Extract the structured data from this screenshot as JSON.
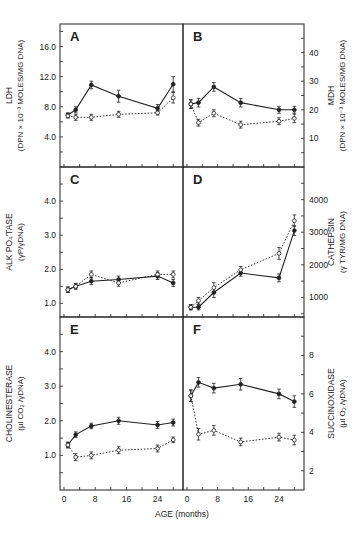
{
  "figure": {
    "xlabel": "AGE (months)",
    "x_ticks_left": [
      "0",
      "8",
      "16",
      "24"
    ],
    "x_ticks_right": [
      "0",
      "8",
      "16",
      "24"
    ]
  },
  "chart_data": [
    {
      "panel": "A",
      "type": "line",
      "ylabel": "LDH",
      "ylabel2": "(DPN × 10⁻³ MOLES/MG DNA)",
      "axis_side": "left",
      "ylim": [
        0,
        19
      ],
      "yticks": [
        4.0,
        8.0,
        12.0,
        16.0
      ],
      "ytick_labels": [
        "4.0",
        "8.0",
        "12.0",
        "16.0"
      ],
      "x": [
        1,
        3,
        7,
        14,
        24,
        28
      ],
      "series": [
        {
          "name": "solid (filled circles)",
          "style": "solid",
          "values": [
            6.9,
            7.6,
            10.9,
            9.4,
            7.8,
            11.0
          ],
          "err": [
            0.3,
            0.4,
            0.5,
            0.8,
            0.5,
            1.0
          ]
        },
        {
          "name": "dotted (open circles)",
          "style": "dotted",
          "values": [
            6.8,
            6.6,
            6.6,
            7.0,
            7.2,
            9.2
          ],
          "err": [
            0.3,
            0.4,
            0.4,
            0.4,
            0.3,
            0.7
          ]
        }
      ]
    },
    {
      "panel": "B",
      "type": "line",
      "ylabel": "MDH",
      "ylabel2": "(DPN × 10⁻³ MOLES/MG DNA)",
      "axis_side": "right",
      "ylim": [
        0,
        50
      ],
      "yticks": [
        10,
        20,
        30,
        40
      ],
      "ytick_labels": [
        "10",
        "20",
        "30",
        "40"
      ],
      "x": [
        1,
        3,
        7,
        14,
        24,
        28
      ],
      "series": [
        {
          "name": "solid (filled circles)",
          "style": "solid",
          "values": [
            22,
            22.5,
            28,
            22.5,
            20,
            20
          ],
          "err": [
            1.5,
            1.5,
            1.5,
            1.5,
            1.2,
            1.2
          ]
        },
        {
          "name": "dotted (open circles)",
          "style": "dotted",
          "values": [
            22,
            15.5,
            18.8,
            14.8,
            16,
            17
          ],
          "err": [
            1.5,
            1.2,
            1.2,
            1.2,
            1.2,
            1.5
          ]
        }
      ]
    },
    {
      "panel": "C",
      "type": "line",
      "ylabel": "ALK PO₄'TASE",
      "ylabel2": "(γP/γDNA)",
      "axis_side": "left",
      "ylim": [
        0.6,
        5.0
      ],
      "yticks": [
        1.0,
        2.0,
        3.0,
        4.0
      ],
      "ytick_labels": [
        "1.0",
        "2.0",
        "3.0",
        "4.0"
      ],
      "x": [
        1,
        3,
        7,
        14,
        24,
        28
      ],
      "series": [
        {
          "name": "solid (filled circles)",
          "style": "solid",
          "values": [
            1.4,
            1.5,
            1.65,
            1.7,
            1.8,
            1.6
          ],
          "err": [
            0.08,
            0.08,
            0.1,
            0.1,
            0.1,
            0.1
          ]
        },
        {
          "name": "dotted (open circles)",
          "style": "dotted",
          "values": [
            1.4,
            1.5,
            1.85,
            1.6,
            1.85,
            1.85
          ],
          "err": [
            0.08,
            0.08,
            0.1,
            0.1,
            0.1,
            0.1
          ]
        }
      ]
    },
    {
      "panel": "D",
      "type": "line",
      "ylabel": "CATHEPSIN",
      "ylabel2": "(γ TYR/MG DNA)",
      "axis_side": "right",
      "ylim": [
        400,
        5000
      ],
      "yticks": [
        1000,
        2000,
        3000,
        4000
      ],
      "ytick_labels": [
        "1000",
        "2000",
        "3000",
        "4000"
      ],
      "x": [
        1,
        3,
        7,
        14,
        24,
        28
      ],
      "series": [
        {
          "name": "solid (filled circles)",
          "style": "solid",
          "values": [
            700,
            700,
            1150,
            1750,
            1600,
            3050
          ],
          "err": [
            80,
            80,
            150,
            100,
            120,
            150
          ]
        },
        {
          "name": "dotted (open circles)",
          "style": "dotted",
          "values": [
            700,
            900,
            1300,
            1850,
            2350,
            3350
          ],
          "err": [
            80,
            100,
            150,
            100,
            180,
            180
          ]
        }
      ]
    },
    {
      "panel": "E",
      "type": "line",
      "ylabel": "CHOLINESTERASE",
      "ylabel2": "(µl CO₂ /γDNA)",
      "axis_side": "left",
      "ylim": [
        0,
        5.0
      ],
      "yticks": [
        1.0,
        2.0,
        3.0,
        4.0
      ],
      "ytick_labels": [
        "1.0",
        "2.0",
        "3.0",
        "4.0"
      ],
      "x": [
        1,
        3,
        7,
        14,
        24,
        28
      ],
      "series": [
        {
          "name": "solid (filled circles)",
          "style": "solid",
          "values": [
            1.3,
            1.6,
            1.85,
            2.0,
            1.88,
            1.95
          ],
          "err": [
            0.08,
            0.08,
            0.08,
            0.1,
            0.1,
            0.1
          ]
        },
        {
          "name": "dotted (open circles)",
          "style": "dotted",
          "values": [
            1.3,
            0.95,
            1.0,
            1.15,
            1.2,
            1.45
          ],
          "err": [
            0.08,
            0.1,
            0.1,
            0.1,
            0.1,
            0.08
          ]
        }
      ]
    },
    {
      "panel": "F",
      "type": "line",
      "ylabel": "SUCCINOXIDASE",
      "ylabel2": "(µl O₂ /γDNA)",
      "axis_side": "right",
      "ylim": [
        1,
        10
      ],
      "yticks": [
        2,
        4,
        6,
        8
      ],
      "ytick_labels": [
        "2",
        "4",
        "6",
        "8"
      ],
      "x": [
        1,
        3,
        7,
        14,
        24,
        28
      ],
      "series": [
        {
          "name": "solid (filled circles)",
          "style": "solid",
          "values": [
            5.9,
            6.6,
            6.3,
            6.5,
            6.0,
            5.6
          ],
          "err": [
            0.3,
            0.25,
            0.25,
            0.3,
            0.25,
            0.3
          ]
        },
        {
          "name": "dotted (open circles)",
          "style": "dotted",
          "values": [
            5.9,
            3.9,
            4.1,
            3.5,
            3.75,
            3.6
          ],
          "err": [
            0.3,
            0.3,
            0.25,
            0.2,
            0.2,
            0.25
          ]
        }
      ]
    }
  ]
}
